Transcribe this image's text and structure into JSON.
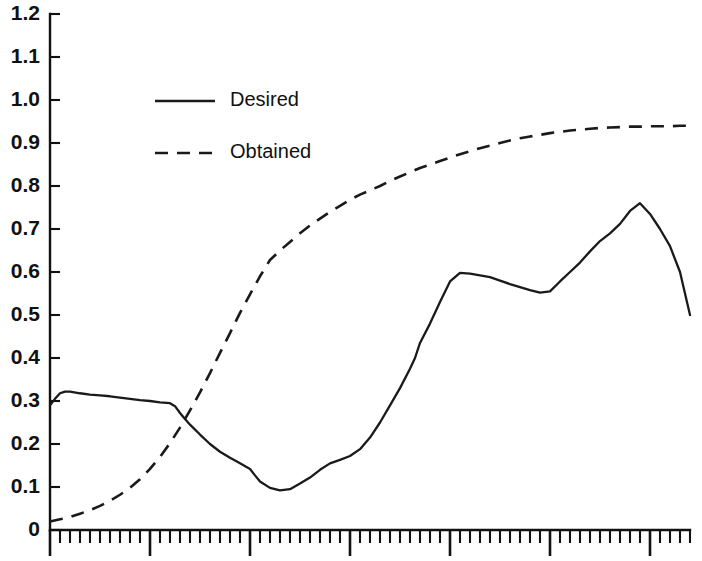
{
  "chart_data": {
    "type": "line",
    "title": "",
    "subtitle": "",
    "xlabel": "",
    "ylabel": "",
    "xlim": [
      0,
      64
    ],
    "ylim": [
      0,
      1.2
    ],
    "grid": false,
    "legend_position": "upper-left",
    "y_ticks": [
      0,
      0.1,
      0.2,
      0.3,
      0.4,
      0.5,
      0.6,
      0.7,
      0.8,
      0.9,
      1.0,
      1.1,
      1.2
    ],
    "y_tick_labels": [
      "0",
      "0.1",
      "0.2",
      "0.3",
      "0.4",
      "0.5",
      "0.6",
      "0.7",
      "0.8",
      "0.9",
      "1.0",
      "1.1",
      "1.2"
    ],
    "x_ticks_minor_count": 64,
    "x_ticks_major_positions": [
      0,
      10,
      20,
      30,
      40,
      50,
      60
    ],
    "x_tick_labels": [],
    "series": [
      {
        "name": "Desired",
        "style": "solid",
        "color": "#1a1a1a",
        "x": [
          0,
          0.5,
          1,
          1.5,
          2,
          3,
          4,
          5,
          6,
          7,
          8,
          9,
          10,
          11,
          12,
          12.5,
          13,
          13.5,
          14,
          15,
          16,
          17,
          18,
          19,
          20,
          20.5,
          21,
          22,
          23,
          24,
          25,
          26,
          27,
          28,
          29,
          30,
          31,
          32,
          33,
          34,
          35,
          36,
          36.5,
          37,
          38,
          39,
          40,
          41,
          42,
          43,
          44,
          45,
          46,
          47,
          48,
          49,
          50,
          51,
          52,
          53,
          54,
          55,
          56,
          57,
          58,
          59,
          60,
          61,
          62,
          63,
          64
        ],
        "y": [
          0.29,
          0.305,
          0.318,
          0.322,
          0.322,
          0.318,
          0.315,
          0.313,
          0.311,
          0.308,
          0.305,
          0.302,
          0.3,
          0.297,
          0.295,
          0.288,
          0.272,
          0.258,
          0.245,
          0.222,
          0.2,
          0.182,
          0.168,
          0.155,
          0.142,
          0.127,
          0.113,
          0.098,
          0.092,
          0.095,
          0.108,
          0.122,
          0.14,
          0.155,
          0.163,
          0.172,
          0.188,
          0.215,
          0.25,
          0.29,
          0.33,
          0.375,
          0.4,
          0.435,
          0.48,
          0.53,
          0.578,
          0.598,
          0.596,
          0.592,
          0.588,
          0.58,
          0.572,
          0.565,
          0.558,
          0.552,
          0.555,
          0.578,
          0.6,
          0.622,
          0.648,
          0.672,
          0.69,
          0.712,
          0.742,
          0.76,
          0.735,
          0.7,
          0.66,
          0.6,
          0.5
        ]
      },
      {
        "name": "Obtained",
        "style": "dashed",
        "color": "#1a1a1a",
        "x": [
          0,
          1,
          2,
          3,
          4,
          5,
          6,
          7,
          8,
          9,
          10,
          11,
          12,
          13,
          14,
          15,
          16,
          17,
          18,
          19,
          20,
          21,
          22,
          23,
          24,
          25,
          26,
          27,
          28,
          29,
          30,
          31,
          32,
          33,
          34,
          35,
          36,
          37,
          38,
          39,
          40,
          41,
          42,
          43,
          44,
          45,
          46,
          47,
          48,
          49,
          50,
          51,
          52,
          53,
          54,
          55,
          56,
          57,
          58,
          59,
          60,
          61,
          62,
          63,
          64
        ],
        "y": [
          0.02,
          0.025,
          0.03,
          0.038,
          0.046,
          0.056,
          0.068,
          0.082,
          0.098,
          0.118,
          0.142,
          0.17,
          0.202,
          0.238,
          0.278,
          0.32,
          0.365,
          0.412,
          0.458,
          0.505,
          0.548,
          0.59,
          0.628,
          0.65,
          0.67,
          0.69,
          0.708,
          0.724,
          0.74,
          0.754,
          0.768,
          0.78,
          0.79,
          0.8,
          0.812,
          0.822,
          0.832,
          0.842,
          0.85,
          0.858,
          0.866,
          0.874,
          0.881,
          0.888,
          0.894,
          0.9,
          0.906,
          0.911,
          0.915,
          0.919,
          0.923,
          0.926,
          0.929,
          0.931,
          0.933,
          0.935,
          0.936,
          0.937,
          0.938,
          0.938,
          0.939,
          0.939,
          0.939,
          0.94,
          0.94
        ]
      }
    ],
    "legend_entries": [
      {
        "label": "Desired",
        "style": "solid"
      },
      {
        "label": "Obtained",
        "style": "dashed"
      }
    ]
  }
}
